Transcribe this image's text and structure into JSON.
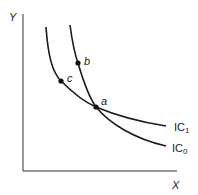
{
  "diagram": {
    "type": "indifference-curves",
    "axes": {
      "y_label": "Y",
      "x_label": "X"
    },
    "curves": [
      {
        "name": "IC1",
        "label_main": "IC",
        "label_sub": "1"
      },
      {
        "name": "IC0",
        "label_main": "IC",
        "label_sub": "0"
      }
    ],
    "points": [
      {
        "name": "a",
        "label": "a"
      },
      {
        "name": "b",
        "label": "b"
      },
      {
        "name": "c",
        "label": "c"
      }
    ],
    "colors": {
      "line": "#1a1a1a",
      "text": "#222222",
      "background": "#ffffff"
    }
  }
}
